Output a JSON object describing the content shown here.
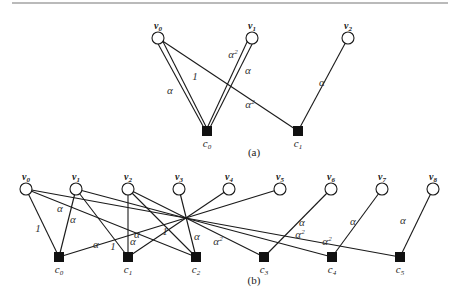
{
  "panels": [
    {
      "id": "a",
      "caption": "(a)",
      "variables": [
        {
          "id": "v0",
          "base": "v",
          "sub": "0"
        },
        {
          "id": "v1",
          "base": "v",
          "sub": "1"
        },
        {
          "id": "v2",
          "base": "v",
          "sub": "2"
        }
      ],
      "checks": [
        {
          "id": "c0",
          "base": "c",
          "sub": "0"
        },
        {
          "id": "c1",
          "base": "c",
          "sub": "1"
        }
      ],
      "edges": [
        {
          "from": "v0",
          "to": "c0",
          "label": "α",
          "double": true,
          "label_side": "outer"
        },
        {
          "from": "v0",
          "to": "c0",
          "label": "1",
          "double": true,
          "label_side": "inner"
        },
        {
          "from": "v1",
          "to": "c0",
          "label": "α²",
          "double": true,
          "label_side": "outer"
        },
        {
          "from": "v1",
          "to": "c0",
          "label": "α",
          "double": true,
          "label_side": "inner"
        },
        {
          "from": "v0",
          "to": "c1",
          "label": "α²"
        },
        {
          "from": "v2",
          "to": "c1",
          "label": "α"
        }
      ]
    },
    {
      "id": "b",
      "caption": "(b)",
      "variables": [
        {
          "id": "v0",
          "base": "v",
          "sub": "0"
        },
        {
          "id": "v1",
          "base": "v",
          "sub": "1"
        },
        {
          "id": "v2",
          "base": "v",
          "sub": "2"
        },
        {
          "id": "v3",
          "base": "v",
          "sub": "3"
        },
        {
          "id": "v4",
          "base": "v",
          "sub": "4"
        },
        {
          "id": "v5",
          "base": "v",
          "sub": "5"
        },
        {
          "id": "v6",
          "base": "v",
          "sub": "6"
        },
        {
          "id": "v7",
          "base": "v",
          "sub": "7"
        },
        {
          "id": "v8",
          "base": "v",
          "sub": "8"
        }
      ],
      "checks": [
        {
          "id": "c0",
          "base": "c",
          "sub": "0"
        },
        {
          "id": "c1",
          "base": "c",
          "sub": "1"
        },
        {
          "id": "c2",
          "base": "c",
          "sub": "2"
        },
        {
          "id": "c3",
          "base": "c",
          "sub": "3"
        },
        {
          "id": "c4",
          "base": "c",
          "sub": "4"
        },
        {
          "id": "c5",
          "base": "c",
          "sub": "5"
        }
      ],
      "edges": [
        {
          "from": "v0",
          "to": "c0",
          "label": "1"
        },
        {
          "from": "v0",
          "to": "c2",
          "label": "α"
        },
        {
          "from": "v0",
          "to": "c5",
          "label": "α²"
        },
        {
          "from": "v1",
          "to": "c0",
          "label": "α"
        },
        {
          "from": "v1",
          "to": "c1",
          "label": "1"
        },
        {
          "from": "v1",
          "to": "c4",
          "label": "α²"
        },
        {
          "from": "v2",
          "to": "c1",
          "label": "α"
        },
        {
          "from": "v2",
          "to": "c2",
          "label": "1"
        },
        {
          "from": "v2",
          "to": "c3",
          "label": "α²"
        },
        {
          "from": "v3",
          "to": "c2",
          "label": "α"
        },
        {
          "from": "v4",
          "to": "c1",
          "label": "α"
        },
        {
          "from": "v5",
          "to": "c0",
          "label": "α"
        },
        {
          "from": "v6",
          "to": "c3",
          "label": "α"
        },
        {
          "from": "v7",
          "to": "c4",
          "label": "α"
        },
        {
          "from": "v8",
          "to": "c5",
          "label": "α"
        }
      ]
    }
  ]
}
